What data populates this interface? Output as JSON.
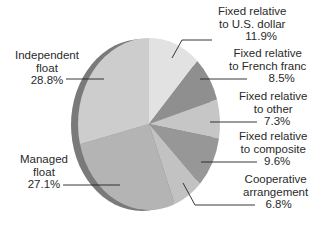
{
  "chart_data": {
    "type": "pie",
    "title": "",
    "start_angle_deg": 0,
    "direction": "clockwise",
    "slices": [
      {
        "label": "Fixed relative to U.S. dollar",
        "lines": [
          "Fixed relative",
          "to U.S. dollar",
          "11.9%"
        ],
        "value": 11.9,
        "color": "#e2e2e2"
      },
      {
        "label": "Fixed relative to French franc",
        "lines": [
          "Fixed relative",
          "to French franc",
          "8.5%"
        ],
        "value": 8.5,
        "color": "#8f8f8f"
      },
      {
        "label": "Fixed relative to other",
        "lines": [
          "Fixed relative",
          "to other",
          "7.3%"
        ],
        "value": 7.3,
        "color": "#c6c6c6"
      },
      {
        "label": "Fixed relative to composite",
        "lines": [
          "Fixed relative",
          "to composite",
          "9.6%"
        ],
        "value": 9.6,
        "color": "#979797"
      },
      {
        "label": "Cooperative arrangement",
        "lines": [
          "Cooperative",
          "arrangement",
          "6.8%"
        ],
        "value": 6.8,
        "color": "#c2c2c2"
      },
      {
        "label": "Managed float",
        "lines": [
          "Managed",
          "float",
          "27.1%"
        ],
        "value": 27.1,
        "color": "#b4b4b4"
      },
      {
        "label": "Independent float",
        "lines": [
          "Independent",
          "float",
          "28.8%"
        ],
        "value": 28.8,
        "color": "#cdcdcd"
      }
    ],
    "edge_color": "#7a7a7a",
    "legend": "none (direct labels with leader lines)"
  }
}
